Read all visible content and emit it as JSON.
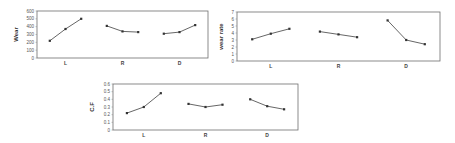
{
  "chart_data": [
    {
      "type": "line",
      "title": "",
      "xlabel": "",
      "ylabel": "Wear",
      "ylim": [
        0,
        600
      ],
      "yticks": [
        0,
        100,
        200,
        300,
        400,
        500,
        600
      ],
      "grid": false,
      "legend": "none",
      "groups": [
        {
          "label": "L",
          "values": [
            220,
            370,
            500
          ]
        },
        {
          "label": "R",
          "values": [
            410,
            340,
            330
          ]
        },
        {
          "label": "D",
          "values": [
            310,
            330,
            420
          ]
        }
      ],
      "frame": {
        "x": 37,
        "y": 11,
        "w": 171,
        "h": 47
      },
      "color": "#555555"
    },
    {
      "type": "line",
      "title": "",
      "xlabel": "",
      "ylabel": "wear rate",
      "ylim": [
        0,
        7
      ],
      "yticks": [
        0,
        1,
        2,
        3,
        4,
        5,
        6,
        7
      ],
      "grid": false,
      "legend": "none",
      "groups": [
        {
          "label": "L",
          "values": [
            3.1,
            3.9,
            4.6
          ]
        },
        {
          "label": "R",
          "values": [
            4.2,
            3.8,
            3.4
          ]
        },
        {
          "label": "D",
          "values": [
            5.8,
            3.0,
            2.4
          ]
        }
      ],
      "frame": {
        "x": 237,
        "y": 12,
        "w": 203,
        "h": 49
      },
      "color": "#555555"
    },
    {
      "type": "line",
      "title": "",
      "xlabel": "",
      "ylabel": "C.F",
      "ylim": [
        0,
        0.6
      ],
      "yticks": [
        0,
        0.1,
        0.2,
        0.3,
        0.4,
        0.5,
        0.6
      ],
      "grid": false,
      "legend": "none",
      "groups": [
        {
          "label": "L",
          "values": [
            0.22,
            0.3,
            0.48
          ]
        },
        {
          "label": "R",
          "values": [
            0.34,
            0.3,
            0.33
          ]
        },
        {
          "label": "D",
          "values": [
            0.4,
            0.31,
            0.27
          ]
        }
      ],
      "frame": {
        "x": 113,
        "y": 84,
        "w": 185,
        "h": 46
      },
      "color": "#555555"
    }
  ]
}
